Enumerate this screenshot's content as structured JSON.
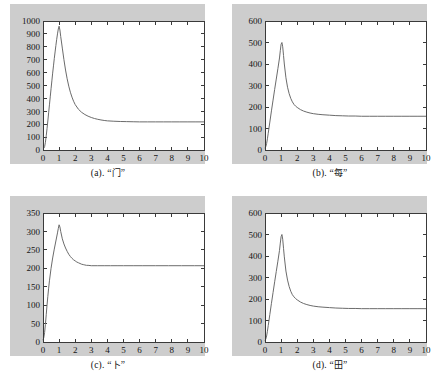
{
  "figure": {
    "background_color": "#ffffff",
    "panel_background_color": "#cdcdcd",
    "plot_face_color": "#ffffff",
    "curve_color": "#6b6b6b",
    "axis_color": "#3a3a3a",
    "layout": "2x2 grid of line plots"
  },
  "panels": [
    {
      "key": "a",
      "caption_prefix": "(a). ",
      "caption_quote_open": "“",
      "caption_char": "门",
      "caption_quote_close": "”",
      "caption_full": "(a). “门”"
    },
    {
      "key": "b",
      "caption_prefix": "(b). ",
      "caption_quote_open": "“",
      "caption_char": "每",
      "caption_quote_close": "”",
      "caption_full": "(b). “每”"
    },
    {
      "key": "c",
      "caption_prefix": "(c). ",
      "caption_quote_open": "“",
      "caption_char": "卜",
      "caption_quote_close": "”",
      "caption_full": "(c). “卜”"
    },
    {
      "key": "d",
      "caption_prefix": "(d). ",
      "caption_quote_open": "“",
      "caption_char": "田",
      "caption_quote_close": "”",
      "caption_full": "(d). “田”"
    }
  ],
  "chart_data": [
    {
      "id": "panel-a",
      "type": "line",
      "title": "",
      "subtitle": "",
      "xlabel": "",
      "ylabel": "",
      "xlim": [
        0,
        10
      ],
      "ylim": [
        0,
        1000
      ],
      "xticks": [
        0,
        1,
        2,
        3,
        4,
        5,
        6,
        7,
        8,
        9,
        10
      ],
      "yticks": [
        0,
        100,
        200,
        300,
        400,
        500,
        600,
        700,
        800,
        900,
        1000
      ],
      "xticklabels": [
        "0",
        "1",
        "2",
        "3",
        "4",
        "5",
        "6",
        "7",
        "8",
        "9",
        "10"
      ],
      "yticklabels": [
        "0",
        "100",
        "200",
        "300",
        "400",
        "500",
        "600",
        "700",
        "800",
        "900",
        "1000"
      ],
      "grid": false,
      "legend": null,
      "peak": {
        "x": 1.0,
        "y": 960
      },
      "plateau": 218,
      "series": [
        {
          "name": "curve",
          "color": "#6b6b6b",
          "x": [
            0.0,
            0.05,
            0.1,
            0.15,
            0.2,
            0.25,
            0.3,
            0.35,
            0.4,
            0.45,
            0.5,
            0.55,
            0.6,
            0.65,
            0.7,
            0.75,
            0.8,
            0.85,
            0.9,
            0.95,
            1.0,
            1.05,
            1.1,
            1.2,
            1.3,
            1.4,
            1.5,
            1.6,
            1.7,
            1.8,
            1.9,
            2.0,
            2.2,
            2.4,
            2.6,
            2.8,
            3.0,
            3.2,
            3.4,
            3.6,
            3.8,
            4.0,
            4.4,
            4.8,
            5.2,
            5.6,
            6.0,
            6.5,
            7.0,
            7.5,
            8.0,
            8.5,
            9.0,
            9.5,
            10.0
          ],
          "y": [
            8,
            14,
            26,
            60,
            110,
            165,
            225,
            288,
            350,
            412,
            475,
            536,
            596,
            652,
            708,
            760,
            810,
            858,
            900,
            938,
            960,
            930,
            880,
            790,
            700,
            620,
            552,
            495,
            448,
            410,
            378,
            352,
            316,
            292,
            275,
            262,
            252,
            244,
            238,
            233,
            229,
            226,
            223,
            221,
            220,
            219,
            218,
            218,
            218,
            218,
            218,
            218,
            218,
            218,
            218
          ]
        }
      ]
    },
    {
      "id": "panel-b",
      "type": "line",
      "title": "",
      "subtitle": "",
      "xlabel": "",
      "ylabel": "",
      "xlim": [
        0,
        10
      ],
      "ylim": [
        0,
        600
      ],
      "xticks": [
        0,
        1,
        2,
        3,
        4,
        5,
        6,
        7,
        8,
        9,
        10
      ],
      "yticks": [
        0,
        100,
        200,
        300,
        400,
        500,
        600
      ],
      "xticklabels": [
        "0",
        "1",
        "2",
        "3",
        "4",
        "5",
        "6",
        "7",
        "8",
        "9",
        "10"
      ],
      "yticklabels": [
        "0",
        "100",
        "200",
        "300",
        "400",
        "500",
        "600"
      ],
      "grid": false,
      "legend": null,
      "peak": {
        "x": 1.05,
        "y": 500
      },
      "plateau": 157,
      "series": [
        {
          "name": "curve",
          "color": "#6b6b6b",
          "x": [
            0.0,
            0.05,
            0.1,
            0.15,
            0.2,
            0.3,
            0.4,
            0.5,
            0.6,
            0.7,
            0.8,
            0.9,
            0.95,
            1.0,
            1.05,
            1.1,
            1.15,
            1.2,
            1.3,
            1.4,
            1.5,
            1.6,
            1.7,
            1.8,
            1.9,
            2.0,
            2.2,
            2.4,
            2.6,
            2.8,
            3.0,
            3.3,
            3.6,
            4.0,
            4.4,
            4.8,
            5.2,
            5.6,
            6.0,
            6.5,
            7.0,
            7.5,
            8.0,
            8.5,
            9.0,
            9.5,
            10.0
          ],
          "y": [
            8,
            16,
            30,
            52,
            78,
            130,
            182,
            232,
            282,
            330,
            378,
            428,
            462,
            492,
            500,
            480,
            440,
            400,
            336,
            292,
            262,
            240,
            224,
            212,
            204,
            198,
            188,
            181,
            176,
            172,
            169,
            166,
            164,
            162,
            160,
            159,
            158,
            158,
            157,
            157,
            157,
            157,
            157,
            157,
            157,
            157,
            157
          ]
        }
      ]
    },
    {
      "id": "panel-c",
      "type": "line",
      "title": "",
      "subtitle": "",
      "xlabel": "",
      "ylabel": "",
      "xlim": [
        0,
        10
      ],
      "ylim": [
        0,
        350
      ],
      "xticks": [
        0,
        1,
        2,
        3,
        4,
        5,
        6,
        7,
        8,
        9,
        10
      ],
      "yticks": [
        0,
        50,
        100,
        150,
        200,
        250,
        300,
        350
      ],
      "xticklabels": [
        "0",
        "1",
        "2",
        "3",
        "4",
        "5",
        "6",
        "7",
        "8",
        "9",
        "10"
      ],
      "yticklabels": [
        "0",
        "50",
        "100",
        "150",
        "200",
        "250",
        "300",
        "350"
      ],
      "grid": false,
      "legend": null,
      "peak": {
        "x": 1.0,
        "y": 320
      },
      "plateau": 207,
      "series": [
        {
          "name": "curve",
          "color": "#6b6b6b",
          "x": [
            0.0,
            0.05,
            0.1,
            0.15,
            0.2,
            0.25,
            0.3,
            0.35,
            0.4,
            0.5,
            0.6,
            0.7,
            0.8,
            0.9,
            0.95,
            1.0,
            1.05,
            1.1,
            1.2,
            1.3,
            1.4,
            1.5,
            1.6,
            1.7,
            1.8,
            1.9,
            2.0,
            2.1,
            2.2,
            2.3,
            2.4,
            2.5,
            2.6,
            2.7,
            2.8,
            3.0,
            3.4,
            3.8,
            4.2,
            4.6,
            5.0,
            5.6,
            6.2,
            7.0,
            7.8,
            8.6,
            9.4,
            10.0
          ],
          "y": [
            5,
            12,
            26,
            48,
            74,
            100,
            124,
            146,
            166,
            200,
            228,
            252,
            274,
            296,
            308,
            318,
            312,
            300,
            280,
            266,
            255,
            246,
            238,
            232,
            227,
            223,
            220,
            217,
            215,
            213,
            211,
            210,
            209,
            208,
            208,
            207,
            207,
            207,
            207,
            207,
            207,
            207,
            207,
            207,
            207,
            207,
            207,
            207
          ]
        }
      ]
    },
    {
      "id": "panel-d",
      "type": "line",
      "title": "",
      "subtitle": "",
      "xlabel": "",
      "ylabel": "",
      "xlim": [
        0,
        10
      ],
      "ylim": [
        0,
        600
      ],
      "xticks": [
        0,
        1,
        2,
        3,
        4,
        5,
        6,
        7,
        8,
        9,
        10
      ],
      "yticks": [
        0,
        100,
        200,
        300,
        400,
        500,
        600
      ],
      "xticklabels": [
        "0",
        "1",
        "2",
        "3",
        "4",
        "5",
        "6",
        "7",
        "8",
        "9",
        "10"
      ],
      "yticklabels": [
        "0",
        "100",
        "200",
        "300",
        "400",
        "500",
        "600"
      ],
      "grid": false,
      "legend": null,
      "peak": {
        "x": 1.05,
        "y": 500
      },
      "plateau": 155,
      "series": [
        {
          "name": "curve",
          "color": "#6b6b6b",
          "x": [
            0.0,
            0.05,
            0.1,
            0.15,
            0.2,
            0.3,
            0.4,
            0.5,
            0.6,
            0.7,
            0.8,
            0.9,
            0.95,
            1.0,
            1.05,
            1.1,
            1.15,
            1.2,
            1.3,
            1.4,
            1.5,
            1.6,
            1.7,
            1.8,
            1.9,
            2.0,
            2.2,
            2.4,
            2.6,
            2.8,
            3.0,
            3.3,
            3.6,
            4.0,
            4.4,
            4.8,
            5.2,
            5.6,
            6.0,
            6.5,
            7.0,
            7.5,
            8.0,
            8.5,
            9.0,
            9.5,
            10.0
          ],
          "y": [
            6,
            14,
            28,
            50,
            76,
            128,
            180,
            230,
            280,
            328,
            376,
            426,
            460,
            490,
            500,
            478,
            436,
            396,
            330,
            288,
            258,
            236,
            220,
            210,
            202,
            196,
            186,
            179,
            174,
            170,
            167,
            164,
            162,
            160,
            158,
            157,
            156,
            156,
            155,
            155,
            155,
            155,
            155,
            155,
            155,
            155,
            155
          ]
        }
      ]
    }
  ]
}
